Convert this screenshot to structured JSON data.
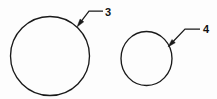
{
  "figure": {
    "kind": "technical-line-drawing",
    "background_color": "#fdfdfd",
    "line_color": "#1a1a1a",
    "width": 217,
    "height": 99,
    "shapes": [
      {
        "id": "circle-large",
        "name": "large-circle",
        "type": "ellipse",
        "cx": 50.0,
        "cy": 56.0,
        "rx": 39.5,
        "ry": 39.5,
        "stroke_width": 1.35
      },
      {
        "id": "circle-small",
        "name": "small-circle",
        "type": "ellipse",
        "cx": 146.5,
        "cy": 58.5,
        "rx": 25.5,
        "ry": 27.0,
        "stroke_width": 1.35
      }
    ],
    "callouts": [
      {
        "id": "callout-3",
        "label": "3",
        "target_shape": "large-circle",
        "label_x": 105,
        "label_y": 16,
        "tip_x": 77,
        "tip_y": 27,
        "elbow_x": 89,
        "elbow_y": 11,
        "tail_x": 103,
        "tail_y": 11
      },
      {
        "id": "callout-4",
        "label": "4",
        "target_shape": "small-circle",
        "label_x": 203,
        "label_y": 33,
        "tip_x": 168,
        "tip_y": 47,
        "elbow_x": 185,
        "elbow_y": 29,
        "tail_x": 200,
        "tail_y": 29
      }
    ]
  }
}
